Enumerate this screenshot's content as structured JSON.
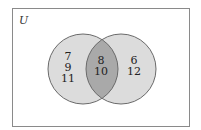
{
  "diagram": {
    "type": "venn",
    "universe_label": "U",
    "sets": [
      {
        "name": "left-set",
        "only_elements": [
          "7",
          "9",
          "11"
        ]
      },
      {
        "name": "right-set",
        "only_elements": [
          "6",
          "12"
        ]
      }
    ],
    "intersection": [
      "8",
      "10"
    ],
    "colors": {
      "background": "#ffffff",
      "border": "#8a8a8a",
      "circle_fill": "#dcdcdc",
      "intersection_fill": "#a9a9a9",
      "circle_stroke": "#6a6a6a"
    }
  }
}
